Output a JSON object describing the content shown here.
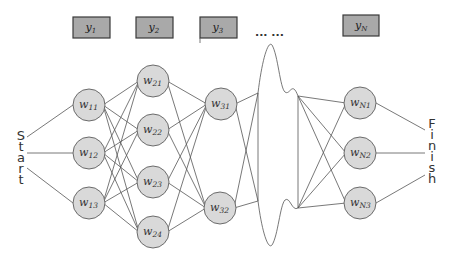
{
  "diagram": {
    "start_label": "Start",
    "finish_label": "Finish",
    "ellipsis": "... ...",
    "outputs": [
      {
        "id": "y1",
        "base": "y",
        "sub": "1",
        "x": 73,
        "y": 17,
        "w": 37,
        "h": 21
      },
      {
        "id": "y2",
        "base": "y",
        "sub": "2",
        "x": 136,
        "y": 17,
        "w": 37,
        "h": 21
      },
      {
        "id": "y3",
        "base": "y",
        "sub": "3",
        "x": 200,
        "y": 17,
        "w": 37,
        "h": 21
      },
      {
        "id": "yN",
        "base": "y",
        "sub": "N",
        "x": 343,
        "y": 15,
        "w": 36,
        "h": 21
      }
    ],
    "layers": [
      {
        "name": "layer-1",
        "nodes": [
          {
            "id": "w11",
            "base": "w",
            "sub": "11",
            "cx": 89,
            "cy": 105
          },
          {
            "id": "w12",
            "base": "w",
            "sub": "12",
            "cx": 89,
            "cy": 153
          },
          {
            "id": "w13",
            "base": "w",
            "sub": "13",
            "cx": 89,
            "cy": 203
          }
        ]
      },
      {
        "name": "layer-2",
        "nodes": [
          {
            "id": "w21",
            "base": "w",
            "sub": "21",
            "cx": 153,
            "cy": 81
          },
          {
            "id": "w22",
            "base": "w",
            "sub": "22",
            "cx": 153,
            "cy": 130
          },
          {
            "id": "w23",
            "base": "w",
            "sub": "23",
            "cx": 153,
            "cy": 182
          },
          {
            "id": "w24",
            "base": "w",
            "sub": "24",
            "cx": 153,
            "cy": 232
          }
        ]
      },
      {
        "name": "layer-3",
        "nodes": [
          {
            "id": "w31",
            "base": "w",
            "sub": "31",
            "cx": 221,
            "cy": 104
          },
          {
            "id": "w32",
            "base": "w",
            "sub": "32",
            "cx": 220,
            "cy": 208
          }
        ]
      },
      {
        "name": "layer-N",
        "nodes": [
          {
            "id": "wN1",
            "base": "w",
            "sub": "N1",
            "cx": 360,
            "cy": 103
          },
          {
            "id": "wN2",
            "base": "w",
            "sub": "N2",
            "cx": 360,
            "cy": 153
          },
          {
            "id": "wN3",
            "base": "w",
            "sub": "N3",
            "cx": 360,
            "cy": 203
          }
        ]
      }
    ],
    "colors": {
      "node_fill": "#d9d9d9",
      "node_stroke": "#6b6b6b",
      "box_fill": "#a9a9a9",
      "box_stroke": "#3a3a3a",
      "edge": "#555555"
    }
  }
}
